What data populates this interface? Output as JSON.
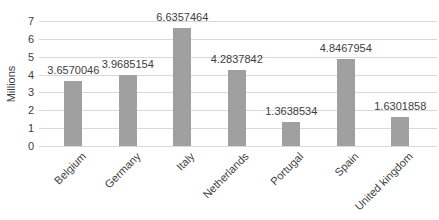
{
  "chart_data": {
    "type": "bar",
    "categories": [
      "Belgium",
      "Germany",
      "Italy",
      "Netherlands",
      "Portugal",
      "Spain",
      "United kingdom"
    ],
    "values": [
      3.6570046,
      3.9685154,
      6.6357464,
      4.2837842,
      1.3638534,
      4.8467954,
      1.6301858
    ],
    "data_labels": [
      "3.6570046",
      "3.9685154",
      "6.6357464",
      "4.2837842",
      "1.3638534",
      "4.8467954",
      "1.6301858"
    ],
    "title": "",
    "xlabel": "",
    "ylabel": "Millions",
    "ylim": [
      0,
      7
    ],
    "yticks": [
      0,
      1,
      2,
      3,
      4,
      5,
      6,
      7
    ],
    "grid": true,
    "legend": false,
    "colors": {
      "bar": "#a0a0a0",
      "gridline": "#d9d9d9",
      "text": "#404040"
    }
  }
}
